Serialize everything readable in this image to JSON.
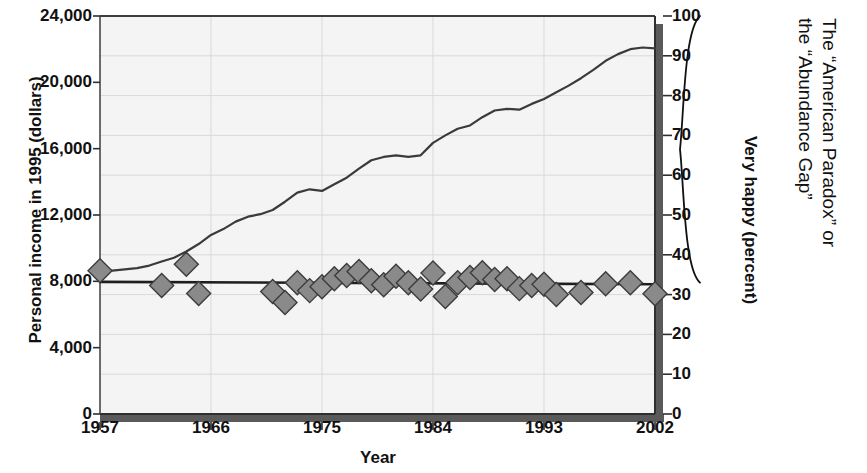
{
  "chart_data": {
    "type": "line",
    "title": "",
    "xlabel": "Year",
    "ylabel_left": "Personal income in 1995 (dollars)",
    "ylabel_right": "Very happy (percent)",
    "xlim": [
      1957,
      2002
    ],
    "grid": true,
    "legend": "none",
    "annotations": [
      {
        "name": "abundance-gap-brace",
        "text_lines": [
          "The “American Paradox” or",
          "the “Abundance Gap”"
        ],
        "span_right_axis": [
          33,
          100
        ]
      }
    ],
    "axes": {
      "left": {
        "label": "Personal income in 1995 (dollars)",
        "ticks": [
          0,
          4000,
          8000,
          12000,
          16000,
          20000,
          24000
        ],
        "tick_labels": [
          "0",
          "4,000",
          "8,000",
          "12,000",
          "16,000",
          "20,000",
          "24,000"
        ],
        "min": 0,
        "max": 24000
      },
      "right": {
        "label": "Very happy (percent)",
        "ticks": [
          0,
          10,
          20,
          30,
          40,
          50,
          60,
          70,
          80,
          90,
          100
        ],
        "tick_labels": [
          "0",
          "10",
          "20",
          "30",
          "40",
          "50",
          "60",
          "70",
          "80",
          "90",
          "100"
        ],
        "min": 0,
        "max": 100
      },
      "x": {
        "label": "Year",
        "ticks": [
          1957,
          1966,
          1975,
          1984,
          1993,
          2002
        ],
        "tick_labels": [
          "1957",
          "1966",
          "1975",
          "1984",
          "1993",
          "2002"
        ],
        "min": 1957,
        "max": 2002
      }
    },
    "series": [
      {
        "name": "Personal income in 1995 dollars",
        "axis": "left",
        "type": "line",
        "color": "#3a3a3a",
        "x": [
          1957,
          1958,
          1959,
          1960,
          1961,
          1962,
          1963,
          1964,
          1965,
          1966,
          1967,
          1968,
          1969,
          1970,
          1971,
          1972,
          1973,
          1974,
          1975,
          1976,
          1977,
          1978,
          1979,
          1980,
          1981,
          1982,
          1983,
          1984,
          1985,
          1986,
          1987,
          1988,
          1989,
          1990,
          1991,
          1992,
          1993,
          1994,
          1995,
          1996,
          1997,
          1998,
          1999,
          2000,
          2001,
          2002
        ],
        "y": [
          8700,
          8650,
          8720,
          8800,
          8950,
          9200,
          9420,
          9800,
          10250,
          10800,
          11150,
          11600,
          11900,
          12050,
          12300,
          12800,
          13350,
          13550,
          13450,
          13850,
          14250,
          14800,
          15300,
          15500,
          15600,
          15500,
          15600,
          16350,
          16800,
          17200,
          17400,
          17900,
          18300,
          18400,
          18350,
          18700,
          19000,
          19400,
          19800,
          20250,
          20750,
          21300,
          21700,
          22000,
          22100,
          22050
        ]
      },
      {
        "name": "Very happy (percent)",
        "axis": "right",
        "type": "scatter-with-trend",
        "marker": "diamond",
        "marker_color": "#8a8a8a",
        "marker_edge": "#3c3c3c",
        "trend_color": "#1f1f1f",
        "trend": [
          33.2,
          32.6
        ],
        "points": [
          {
            "x": 1957,
            "y": 36.0
          },
          {
            "x": 1962,
            "y": 32.3
          },
          {
            "x": 1964,
            "y": 37.6
          },
          {
            "x": 1965,
            "y": 30.3
          },
          {
            "x": 1971,
            "y": 30.8
          },
          {
            "x": 1972,
            "y": 28.0
          },
          {
            "x": 1973,
            "y": 33.0
          },
          {
            "x": 1974,
            "y": 31.0
          },
          {
            "x": 1975,
            "y": 32.0
          },
          {
            "x": 1976,
            "y": 34.0
          },
          {
            "x": 1977,
            "y": 34.8
          },
          {
            "x": 1978,
            "y": 35.8
          },
          {
            "x": 1979,
            "y": 33.5
          },
          {
            "x": 1980,
            "y": 32.5
          },
          {
            "x": 1981,
            "y": 34.6
          },
          {
            "x": 1982,
            "y": 33.0
          },
          {
            "x": 1983,
            "y": 31.4
          },
          {
            "x": 1984,
            "y": 35.4
          },
          {
            "x": 1985,
            "y": 29.5
          },
          {
            "x": 1986,
            "y": 33.0
          },
          {
            "x": 1987,
            "y": 34.3
          },
          {
            "x": 1988,
            "y": 35.5
          },
          {
            "x": 1989,
            "y": 33.8
          },
          {
            "x": 1990,
            "y": 34.0
          },
          {
            "x": 1991,
            "y": 31.5
          },
          {
            "x": 1992,
            "y": 32.3
          },
          {
            "x": 1993,
            "y": 32.6
          },
          {
            "x": 1994,
            "y": 30.0
          },
          {
            "x": 1996,
            "y": 30.5
          },
          {
            "x": 1998,
            "y": 32.7
          },
          {
            "x": 2000,
            "y": 33.0
          },
          {
            "x": 2002,
            "y": 30.2
          }
        ]
      }
    ]
  },
  "colors": {
    "plot_background": "#f4f4f4",
    "gridline": "#d9d9d9",
    "axis_line": "#4d4d4d",
    "axis_shadow": "#5a5a5a",
    "income_line": "#3a3a3a",
    "marker_fill": "#8a8a8a",
    "marker_edge": "#3c3c3c",
    "trend_line": "#1f1f1f",
    "text": "#111111"
  }
}
